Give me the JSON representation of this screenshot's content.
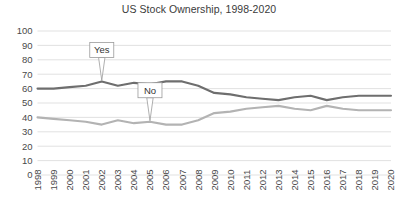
{
  "chart_data": {
    "type": "line",
    "title": "US Stock Ownership, 1998-2020",
    "xlabel": "",
    "ylabel": "",
    "ylim": [
      0,
      100
    ],
    "ytick_step": 10,
    "yticks": [
      "100",
      "90",
      "80",
      "70",
      "60",
      "50",
      "40",
      "30",
      "20",
      "10",
      "0"
    ],
    "grid": true,
    "legend": "inline-callouts",
    "categories": [
      "1998",
      "1999",
      "2000",
      "2001",
      "2002",
      "2003",
      "2004",
      "2005",
      "2006",
      "2007",
      "2008",
      "2009",
      "2010",
      "2011",
      "2012",
      "2013",
      "2014",
      "2015",
      "2016",
      "2017",
      "2018",
      "2019",
      "2020"
    ],
    "series": [
      {
        "name": "Yes",
        "color": "#6e6e6e",
        "label": "Yes",
        "values": [
          60,
          60,
          61,
          62,
          65,
          62,
          64,
          63,
          65,
          65,
          62,
          57,
          56,
          54,
          53,
          52,
          54,
          55,
          52,
          54,
          55,
          55,
          55
        ]
      },
      {
        "name": "No",
        "color": "#b3b3b3",
        "label": "No",
        "values": [
          40,
          39,
          38,
          37,
          35,
          38,
          36,
          37,
          35,
          35,
          38,
          43,
          44,
          46,
          47,
          48,
          46,
          45,
          48,
          46,
          45,
          45,
          45
        ]
      }
    ],
    "annotations": [
      {
        "text": "Yes",
        "series": "Yes",
        "at_category": "2002"
      },
      {
        "text": "No",
        "series": "No",
        "at_category": "2005"
      }
    ],
    "colors": {
      "gridline": "#d9d9d9",
      "axis_text": "#4a4a4a",
      "title": "#3b3b3b",
      "yes_series": "#6e6e6e",
      "no_series": "#b3b3b3",
      "background": "#ffffff"
    }
  }
}
